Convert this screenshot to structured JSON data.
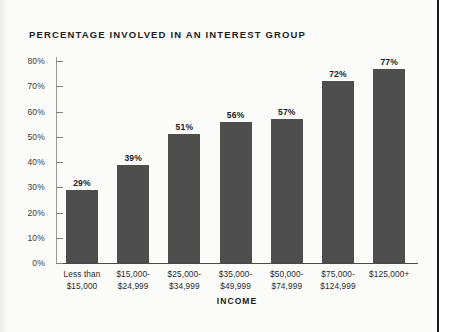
{
  "page": {
    "background_color": "#fbfbfa",
    "gutter_rule_color": "#1b1b1b"
  },
  "chart_data": {
    "type": "bar",
    "title": "PERCENTAGE INVOLVED IN AN INTEREST GROUP",
    "xlabel": "INCOME",
    "ylabel": "",
    "categories": [
      "Less than $15,000",
      "$15,000-$24,999",
      "$25,000-$34,999",
      "$35,000-$49,999",
      "$50,000-$74,999",
      "$75,000-$124,999",
      "$125,000+"
    ],
    "category_lines": [
      [
        "Less than",
        "$15,000"
      ],
      [
        "$15,000-",
        "$24,999"
      ],
      [
        "$25,000-",
        "$34,999"
      ],
      [
        "$35,000-",
        "$49,999"
      ],
      [
        "$50,000-",
        "$74,999"
      ],
      [
        "$75,000-",
        "$124,999"
      ],
      [
        "$125,000+",
        ""
      ]
    ],
    "values": [
      29,
      39,
      51,
      56,
      57,
      72,
      77
    ],
    "value_labels": [
      "29%",
      "39%",
      "51%",
      "56%",
      "57%",
      "72%",
      "77%"
    ],
    "ylim": [
      0,
      80
    ],
    "ytick_values": [
      0,
      10,
      20,
      30,
      40,
      50,
      60,
      70,
      80
    ],
    "ytick_labels": [
      "0%",
      "10%",
      "20%",
      "30%",
      "40%",
      "50%",
      "60%",
      "70%",
      "80%"
    ],
    "grid": false,
    "legend": null,
    "bar_color": "#4e4e4e",
    "axis_color": "#4b4b4b",
    "text_color": "#1c1c1c"
  }
}
